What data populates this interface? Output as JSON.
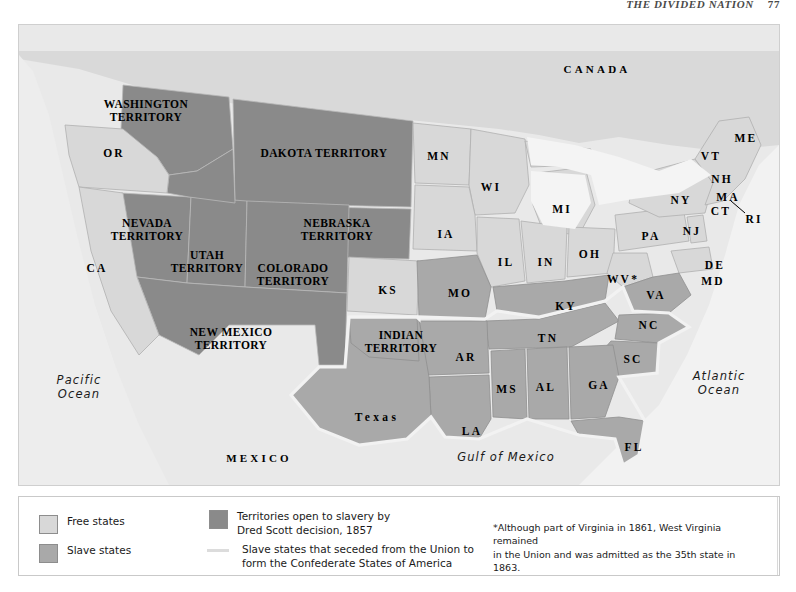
{
  "running_head": {
    "text": "THE DIVIDED NATION",
    "page": "77"
  },
  "map": {
    "title": "Free and Slave States, 1861",
    "colors": {
      "free_state": "#d8d8d8",
      "slave_state": "#a9a9a9",
      "territory_dred_scott": "#8a8a8a",
      "water": "#eeeeee",
      "background": "#e9e9e9",
      "secession_line": "#f2f2f2",
      "border": "#9a9a9a"
    },
    "labels": {
      "countries": [
        {
          "name": "canada",
          "text": "CANADA",
          "x": 578,
          "y": 45
        },
        {
          "name": "mexico",
          "text": "MEXICO",
          "x": 240,
          "y": 434
        }
      ],
      "oceans": [
        {
          "name": "pacific-ocean",
          "text": "Pacific\nOcean",
          "x": 60,
          "y": 362
        },
        {
          "name": "atlantic-ocean",
          "text": "Atlantic\nOcean",
          "x": 700,
          "y": 358
        },
        {
          "name": "gulf-of-mexico",
          "text": "Gulf of Mexico",
          "x": 487,
          "y": 432
        }
      ],
      "territories": [
        {
          "name": "washington-territory",
          "text": "WASHINGTON\nTERRITORY",
          "x": 127,
          "y": 86
        },
        {
          "name": "dakota-territory",
          "text": "DAKOTA TERRITORY",
          "x": 305,
          "y": 128
        },
        {
          "name": "nevada-territory",
          "text": "NEVADA\nTERRITORY",
          "x": 128,
          "y": 205
        },
        {
          "name": "utah-territory",
          "text": "UTAH\nTERRITORY",
          "x": 188,
          "y": 237
        },
        {
          "name": "colorado-territory",
          "text": "COLORADO\nTERRITORY",
          "x": 274,
          "y": 250
        },
        {
          "name": "nebraska-territory",
          "text": "NEBRASKA\nTERRITORY",
          "x": 318,
          "y": 205
        },
        {
          "name": "new-mexico-territory",
          "text": "NEW MEXICO\nTERRITORY",
          "x": 212,
          "y": 314
        },
        {
          "name": "indian-territory",
          "text": "INDIAN\nTERRITORY",
          "x": 382,
          "y": 317
        }
      ],
      "states": [
        {
          "name": "oregon",
          "text": "OR",
          "x": 95,
          "y": 128
        },
        {
          "name": "california",
          "text": "CA",
          "x": 78,
          "y": 243
        },
        {
          "name": "kansas",
          "text": "KS",
          "x": 369,
          "y": 265
        },
        {
          "name": "minnesota",
          "text": "MN",
          "x": 420,
          "y": 131
        },
        {
          "name": "wisconsin",
          "text": "WI",
          "x": 472,
          "y": 162
        },
        {
          "name": "iowa",
          "text": "IA",
          "x": 427,
          "y": 209
        },
        {
          "name": "michigan",
          "text": "MI",
          "x": 543,
          "y": 184
        },
        {
          "name": "illinois",
          "text": "IL",
          "x": 487,
          "y": 237
        },
        {
          "name": "indiana",
          "text": "IN",
          "x": 527,
          "y": 237
        },
        {
          "name": "ohio",
          "text": "OH",
          "x": 571,
          "y": 229
        },
        {
          "name": "pennsylvania",
          "text": "PA",
          "x": 632,
          "y": 211
        },
        {
          "name": "new-york",
          "text": "NY",
          "x": 662,
          "y": 175
        },
        {
          "name": "new-jersey",
          "text": "NJ",
          "x": 673,
          "y": 206
        },
        {
          "name": "vermont",
          "text": "VT",
          "x": 692,
          "y": 131
        },
        {
          "name": "new-hampshire",
          "text": "NH",
          "x": 703,
          "y": 154
        },
        {
          "name": "massachusetts",
          "text": "MA",
          "x": 709,
          "y": 172
        },
        {
          "name": "connecticut",
          "text": "CT",
          "x": 702,
          "y": 186
        },
        {
          "name": "rhode-island",
          "text": "RI",
          "x": 735,
          "y": 194
        },
        {
          "name": "maine",
          "text": "ME",
          "x": 727,
          "y": 113
        },
        {
          "name": "delaware",
          "text": "DE",
          "x": 696,
          "y": 240
        },
        {
          "name": "maryland",
          "text": "MD",
          "x": 694,
          "y": 256
        },
        {
          "name": "west-virginia",
          "text": "WV*",
          "x": 604,
          "y": 254
        },
        {
          "name": "virginia",
          "text": "VA",
          "x": 637,
          "y": 270
        },
        {
          "name": "missouri",
          "text": "MO",
          "x": 441,
          "y": 268
        },
        {
          "name": "kentucky",
          "text": "KY",
          "x": 547,
          "y": 281
        },
        {
          "name": "north-carolina",
          "text": "NC",
          "x": 630,
          "y": 300
        },
        {
          "name": "tennessee",
          "text": "TN",
          "x": 529,
          "y": 313
        },
        {
          "name": "arkansas",
          "text": "AR",
          "x": 447,
          "y": 332
        },
        {
          "name": "south-carolina",
          "text": "SC",
          "x": 614,
          "y": 334
        },
        {
          "name": "mississippi",
          "text": "MS",
          "x": 488,
          "y": 364
        },
        {
          "name": "alabama",
          "text": "AL",
          "x": 527,
          "y": 362
        },
        {
          "name": "georgia",
          "text": "GA",
          "x": 580,
          "y": 360
        },
        {
          "name": "louisiana",
          "text": "LA",
          "x": 453,
          "y": 406
        },
        {
          "name": "florida",
          "text": "FL",
          "x": 615,
          "y": 422
        },
        {
          "name": "texas",
          "text": "Texas",
          "x": 358,
          "y": 392
        }
      ]
    }
  },
  "legend": {
    "items": [
      {
        "name": "legend-free-states",
        "swatch": "free_state",
        "type": "swatch",
        "label": "Free states"
      },
      {
        "name": "legend-slave-states",
        "swatch": "slave_state",
        "type": "swatch",
        "label": "Slave states"
      },
      {
        "name": "legend-territories-dred-scott",
        "swatch": "territory_dred_scott",
        "type": "swatch",
        "label": "Territories open to slavery by\nDred Scott decision, 1857"
      },
      {
        "name": "legend-seceded-states",
        "swatch": "secession_line",
        "type": "line",
        "label": "Slave states that seceded from the Union to\nform the Confederate States of America"
      }
    ],
    "footnote": "*Although part of Virginia in 1861, West Virginia remained\nin the Union and was admitted as the 35th state in 1863."
  }
}
